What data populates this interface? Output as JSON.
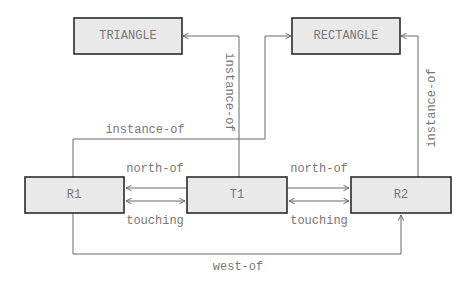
{
  "nodes": {
    "triangle": {
      "label": "TRIANGLE"
    },
    "rectangle": {
      "label": "RECTANGLE"
    },
    "r1": {
      "label": "R1"
    },
    "t1": {
      "label": "T1"
    },
    "r2": {
      "label": "R2"
    }
  },
  "edges": {
    "t1_instance_of_triangle": {
      "label": "instance-of",
      "from": "T1",
      "to": "TRIANGLE"
    },
    "r1_instance_of_rectangle": {
      "label": "instance-of",
      "from": "R1",
      "to": "RECTANGLE"
    },
    "r2_instance_of_rectangle": {
      "label": "instance-of",
      "from": "R2",
      "to": "RECTANGLE"
    },
    "t1_north_of_r1": {
      "label": "north-of",
      "from": "T1",
      "to": "R1"
    },
    "r1_t1_touching": {
      "label": "touching",
      "from": "R1",
      "to": "T1"
    },
    "t1_north_of_r2": {
      "label": "north-of",
      "from": "T1",
      "to": "R2"
    },
    "t1_r2_touching": {
      "label": "touching",
      "from": "T1",
      "to": "R2"
    },
    "r1_west_of_r2": {
      "label": "west-of",
      "from": "R1",
      "to": "R2"
    }
  },
  "colors": {
    "node_fill": "#e9e9e9",
    "node_border": "#2b2b2b",
    "edge": "#6a6a6a",
    "text": "#777777"
  }
}
